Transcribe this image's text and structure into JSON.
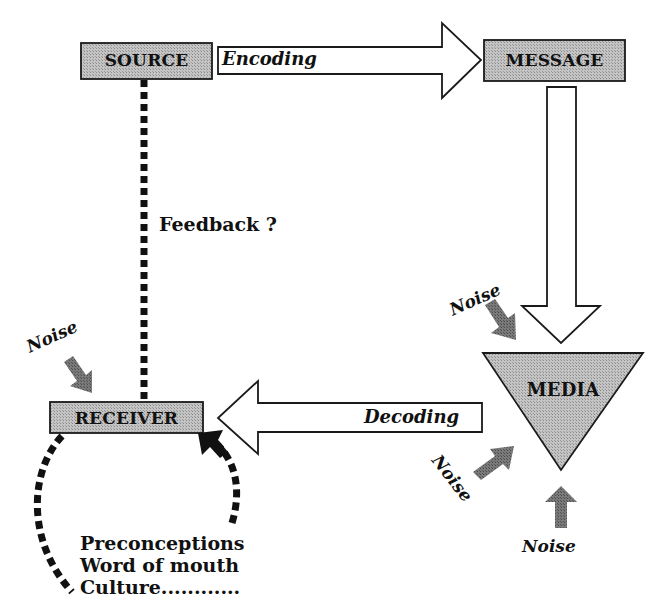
{
  "diagram": {
    "type": "communication-process-model",
    "colors": {
      "box_fill": "#b8b8b8",
      "outline": "#1a1a1a",
      "noise_arrow": "#6e6e6e",
      "feedback_line": "#111111",
      "background": "#ffffff"
    },
    "nodes": {
      "source": "SOURCE",
      "message": "MESSAGE",
      "media": "MEDIA",
      "receiver": "RECEIVER"
    },
    "edges": {
      "encoding": "Encoding",
      "decoding": "Decoding",
      "feedback": "Feedback ?"
    },
    "noise_labels": [
      "Noise",
      "Noise",
      "Noise",
      "Noise"
    ],
    "influences": [
      "Preconceptions",
      "Word of mouth",
      "Culture............"
    ]
  }
}
